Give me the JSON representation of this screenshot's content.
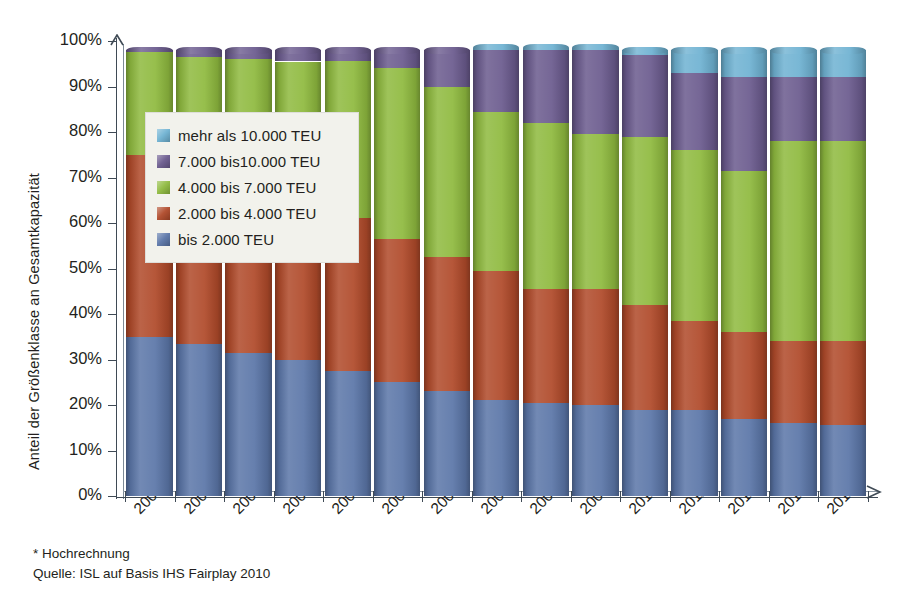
{
  "chart_data": {
    "type": "bar",
    "stacked": true,
    "title": "",
    "xlabel": "",
    "ylabel": "Anteil der Größenklasse an Gesamtkapazität",
    "ylim": [
      0,
      100
    ],
    "ytick_labels": [
      "0%",
      "10%",
      "20%",
      "30%",
      "40%",
      "50%",
      "60%",
      "70%",
      "80%",
      "90%",
      "100%"
    ],
    "ytick_values": [
      0,
      10,
      20,
      30,
      40,
      50,
      60,
      70,
      80,
      90,
      100
    ],
    "grid": false,
    "legend_position": "inside-upper-left",
    "categories": [
      "2000",
      "2001",
      "2002",
      "2003",
      "2004",
      "2005",
      "2006",
      "2007",
      "2008",
      "2009",
      "2010",
      "2011*",
      "2012*",
      "2013*",
      "2014*"
    ],
    "series": [
      {
        "name": "bis 2.000 TEU",
        "color": "#5b76a8",
        "values": [
          35.0,
          33.5,
          31.5,
          30.0,
          27.5,
          25.0,
          23.0,
          21.0,
          20.5,
          20.0,
          19.0,
          19.0,
          17.0,
          16.0,
          15.5
        ]
      },
      {
        "name": "2.000 bis 4.000 TEU",
        "color": "#b04a2a",
        "values": [
          40.0,
          39.5,
          40.0,
          39.0,
          33.5,
          31.5,
          29.5,
          28.5,
          25.0,
          25.5,
          23.0,
          19.5,
          19.0,
          18.0,
          18.5
        ]
      },
      {
        "name": "4.000 bis 7.000 TEU",
        "color": "#8fba3f",
        "values": [
          22.5,
          23.5,
          24.5,
          26.5,
          34.5,
          37.5,
          37.5,
          35.0,
          36.5,
          34.0,
          37.0,
          37.5,
          35.5,
          44.0,
          44.0
        ]
      },
      {
        "name": "7.000 bis10.000 TEU",
        "color": "#6b5b8e",
        "values": [
          0.5,
          1.5,
          2.0,
          2.5,
          2.5,
          4.0,
          8.0,
          13.5,
          16.0,
          18.5,
          18.0,
          17.0,
          20.5,
          14.0,
          14.0
        ]
      },
      {
        "name": "mehr als  10.000 TEU",
        "color": "#6fb2d2",
        "values": [
          0.0,
          0.0,
          0.0,
          0.0,
          0.0,
          0.0,
          0.0,
          0.5,
          0.5,
          0.5,
          1.0,
          5.0,
          6.0,
          6.0,
          6.0
        ]
      }
    ]
  },
  "legend": {
    "items": [
      {
        "label": "mehr als  10.000 TEU",
        "color": "#6fb2d2"
      },
      {
        "label": "7.000 bis10.000 TEU",
        "color": "#6b5b8e"
      },
      {
        "label": "4.000 bis 7.000 TEU",
        "color": "#8fba3f"
      },
      {
        "label": "2.000 bis 4.000 TEU",
        "color": "#b04a2a"
      },
      {
        "label": "bis 2.000 TEU",
        "color": "#5b76a8"
      }
    ]
  },
  "footnotes": {
    "line1": "* Hochrechnung",
    "line2": "Quelle: ISL auf Basis IHS Fairplay 2010"
  },
  "axis_title": {
    "y": "Anteil der Größenklasse an Gesamtkapazität"
  }
}
